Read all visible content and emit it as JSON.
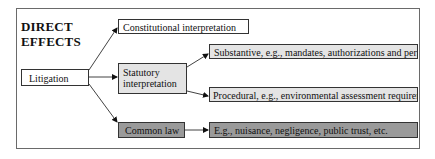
{
  "diagram": {
    "title_lines": [
      "DIRECT",
      "EFFECTS"
    ],
    "nodes": {
      "litigation": "Litigation",
      "constitutional": "Constitutional interpretation",
      "statutory_line1": "Statutory",
      "statutory_line2": "interpretation",
      "substantive": "Substantive, e.g., mandates, authorizations and permits",
      "procedural": "Procedural, e.g., environmental assessment requirements",
      "common_law": "Common law",
      "common_law_examples": "E.g., nuisance, negligence, public trust, etc."
    },
    "edges": [
      {
        "from": "litigation",
        "to": "constitutional"
      },
      {
        "from": "litigation",
        "to": "statutory"
      },
      {
        "from": "litigation",
        "to": "common_law"
      },
      {
        "from": "statutory",
        "to": "substantive"
      },
      {
        "from": "statutory",
        "to": "procedural"
      },
      {
        "from": "common_law",
        "to": "common_law_examples"
      }
    ],
    "colors": {
      "white_box": "#ffffff",
      "light_box": "#e4e4e4",
      "dark_box": "#9a9a9a",
      "border": "#333333"
    }
  }
}
